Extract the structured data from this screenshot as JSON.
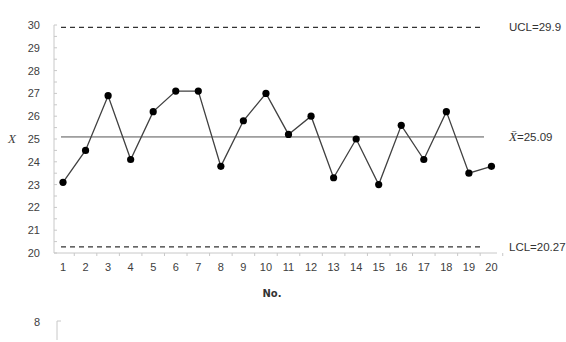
{
  "chart_data": {
    "type": "line",
    "title": "",
    "xlabel": "No.",
    "ylabel": "X",
    "x": [
      1,
      2,
      3,
      4,
      5,
      6,
      7,
      8,
      9,
      10,
      11,
      12,
      13,
      14,
      15,
      16,
      17,
      18,
      19,
      20
    ],
    "series": [
      {
        "name": "X",
        "values": [
          23.1,
          24.5,
          26.9,
          24.1,
          26.2,
          27.1,
          27.1,
          23.8,
          25.8,
          27.0,
          25.2,
          26.0,
          23.3,
          25.0,
          23.0,
          25.6,
          24.1,
          26.2,
          23.5,
          23.8
        ]
      }
    ],
    "ylim": [
      20,
      30
    ],
    "yticks": [
      20,
      21,
      22,
      23,
      24,
      25,
      26,
      27,
      28,
      29,
      30
    ],
    "grid": false,
    "control_lines": [
      {
        "name": "UCL",
        "value": 29.9,
        "label": "UCL=29.9",
        "style": "dashed"
      },
      {
        "name": "CL",
        "value": 25.09,
        "label": "=25.09",
        "label_symbol": "X̄",
        "style": "solid"
      },
      {
        "name": "LCL",
        "value": 20.27,
        "label": "LCL=20.27",
        "style": "dashed"
      }
    ],
    "marker_color": "#000000",
    "line_color": "#404040"
  },
  "fragment": {
    "next_chart_tick": "8"
  }
}
